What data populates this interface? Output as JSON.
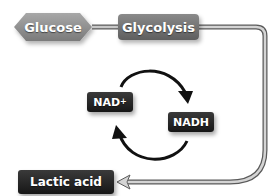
{
  "diagram": {
    "nodes": {
      "glucose": {
        "label": "Glucose"
      },
      "glycolysis": {
        "label": "Glycolysis"
      },
      "nad_plus": {
        "label": "NAD",
        "superscript": "+"
      },
      "nadh": {
        "label": "NADH"
      },
      "lactic_acid": {
        "label": "Lactic acid"
      }
    },
    "edges": [
      {
        "from": "Glucose",
        "to": "Glycolysis",
        "type": "line"
      },
      {
        "from": "Glycolysis",
        "to": "Lactic acid",
        "type": "arrow"
      },
      {
        "from": "NAD+",
        "to": "NADH",
        "type": "curved-arrow"
      },
      {
        "from": "NADH",
        "to": "NAD+",
        "type": "curved-arrow"
      }
    ],
    "colors": {
      "hexagon": "#8c8c8c",
      "dark_box": "#222222",
      "grey_box": "#6e6e6e",
      "connector": "#9a9a9a",
      "cycle_arrow": "#111111"
    }
  }
}
